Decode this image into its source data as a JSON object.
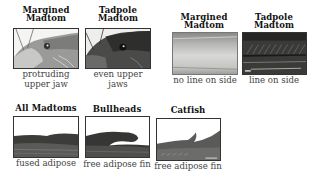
{
  "panels": [
    {
      "title_line1": "Margined",
      "title_line2": "Madtom",
      "caption_line1": "protruding",
      "caption_line2": "upper jaw",
      "image": "margined-madtom-head-illustration"
    },
    {
      "title_line1": "Tadpole",
      "title_line2": "Madtom",
      "caption_line1": "even upper",
      "caption_line2": "jaws",
      "image": "tadpole-madtom-head-illustration"
    },
    {
      "title_line1": "Margined",
      "title_line2": "Madtom",
      "caption_line1": "no line on side",
      "image": "margined-madtom-side-illustration"
    },
    {
      "title_line1": "Tadpole",
      "title_line2": "Madtom",
      "caption_line1": "line on side",
      "image": "tadpole-madtom-side-illustration"
    },
    {
      "title_line1": "All Madtoms",
      "caption_line1": "fused adipose",
      "image": "madtom-adipose-fin-illustration"
    },
    {
      "title_line1": "Bullheads",
      "caption_line1": "free adipose fin",
      "image": "bullhead-adipose-fin-illustration"
    },
    {
      "title_line1": "Catfish",
      "caption_line1": "free adipose fin",
      "image": "catfish-adipose-fin-illustration"
    }
  ]
}
